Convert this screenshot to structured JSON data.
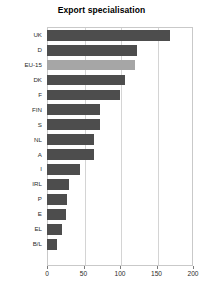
{
  "chart": {
    "title": "Export specialisation"
  },
  "axis": {
    "x_ticks": [
      "0",
      "50",
      "100",
      "150",
      "200"
    ],
    "x_tick_values": [
      0,
      50,
      100,
      150,
      200
    ]
  },
  "chart_data": {
    "type": "bar",
    "orientation": "horizontal",
    "title": "Export specialisation",
    "xlabel": "",
    "ylabel": "",
    "xlim": [
      0,
      200
    ],
    "grid": true,
    "legend": false,
    "categories": [
      "UK",
      "D",
      "EU-15",
      "DK",
      "F",
      "FIN",
      "S",
      "NL",
      "A",
      "I",
      "IRL",
      "P",
      "E",
      "EL",
      "B/L"
    ],
    "values": [
      168,
      123,
      120,
      107,
      100,
      72,
      72,
      64,
      64,
      45,
      30,
      28,
      26,
      21,
      14
    ],
    "highlight_category": "EU-15",
    "colors": {
      "bar": "#4d4d4d",
      "highlight_bar": "#a6a6a6",
      "grid": "#d4d4d4",
      "frame": "#c9c9c9",
      "text": "#2b2b2b"
    }
  }
}
